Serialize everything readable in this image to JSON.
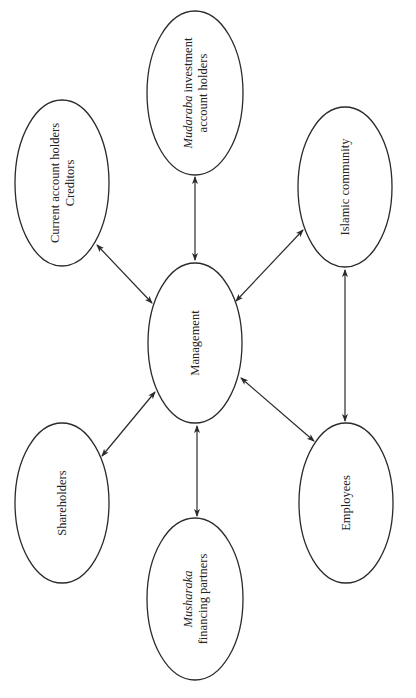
{
  "diagram": {
    "type": "stakeholder-network",
    "orientation": "rotated-90-ccw",
    "colors": {
      "stroke": "#2a2a2a",
      "text": "#222222",
      "background": "#ffffff"
    },
    "center_node": {
      "id": "management",
      "label": "Management"
    },
    "nodes": [
      {
        "id": "current",
        "lines": [
          "Current account holders",
          "Creditors"
        ],
        "italic_prefix": ""
      },
      {
        "id": "mudaraba",
        "line1_italic": "Mudaraba",
        "line1_rest": " investment",
        "line2": "account holders"
      },
      {
        "id": "islamic",
        "label": "Islamic community"
      },
      {
        "id": "shareholders",
        "label": "Shareholders"
      },
      {
        "id": "musharaka",
        "line1_italic": "Musharaka",
        "line2": "financing partners"
      },
      {
        "id": "employees",
        "label": "Employees"
      }
    ],
    "edges": [
      {
        "from": "management",
        "to": "current",
        "direction": "bidirectional"
      },
      {
        "from": "management",
        "to": "mudaraba",
        "direction": "bidirectional"
      },
      {
        "from": "management",
        "to": "islamic",
        "direction": "bidirectional"
      },
      {
        "from": "management",
        "to": "shareholders",
        "direction": "bidirectional"
      },
      {
        "from": "management",
        "to": "musharaka",
        "direction": "bidirectional"
      },
      {
        "from": "management",
        "to": "employees",
        "direction": "bidirectional"
      },
      {
        "from": "islamic",
        "to": "employees",
        "direction": "bidirectional"
      }
    ]
  },
  "labels": {
    "management": "Management",
    "current_line1": "Current account holders",
    "current_line2": "Creditors",
    "mudaraba_italic": "Mudaraba",
    "mudaraba_rest": " investment",
    "mudaraba_line2": "account holders",
    "islamic": "Islamic community",
    "shareholders": "Shareholders",
    "musharaka_italic": "Musharaka",
    "musharaka_line2": "financing partners",
    "employees": "Employees"
  }
}
